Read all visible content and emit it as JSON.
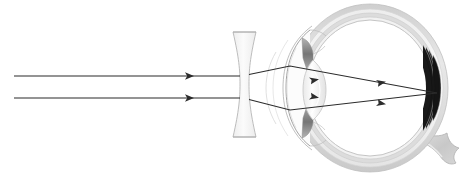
{
  "diagram": {
    "title": "Myopia correction with a diverging lens",
    "background_color": "#ffffff",
    "width": 470,
    "height": 177
  },
  "colors": {
    "ray_stroke": "#2b2b2b",
    "lens_fill": "#f2f2f2",
    "lens_stroke": "#b6b6b6",
    "sclera_outer": "#d2d2d2",
    "sclera_mid": "#e6e6e6",
    "sclera_inner": "#f4f4f4",
    "cornea_stroke": "#9a9a9a",
    "iris_fill": "#8e8e8e",
    "crystalline_fill": "#f6f6f6",
    "crystalline_stroke": "#c4c4c4",
    "retina_stroke": "#bdbdbd",
    "optic_nerve_fill": "#cfcfcf",
    "vitreous_fill": "#ffffff"
  },
  "rays": {
    "count": 2,
    "description": "Two parallel incoming light rays",
    "incoming": [
      {
        "name": "upper-ray",
        "x1": 14,
        "y1": 76,
        "x2": 233,
        "y2": 76,
        "arrow_x": 192,
        "arrow_y": 76
      },
      {
        "name": "lower-ray",
        "x1": 14,
        "y1": 98,
        "x2": 233,
        "y2": 98,
        "arrow_x": 192,
        "arrow_y": 98
      }
    ],
    "refracted": [
      {
        "name": "upper-refracted-ray",
        "points": "256,72 289,66 437,93",
        "arrow_x": 385,
        "arrow_y": 83
      },
      {
        "name": "lower-refracted-ray",
        "points": "256,101 289,110 437,93",
        "arrow_x": 385,
        "arrow_y": 104
      }
    ],
    "focus_point": {
      "x": 437,
      "y": 93,
      "label": "retina focal point"
    }
  },
  "corrective_lens": {
    "name": "biconcave-diverging-lens",
    "type": "concave",
    "x_left": 233,
    "x_right": 256,
    "y_top": 32,
    "y_bottom": 137,
    "waist_width": 7
  },
  "eye": {
    "name": "human-eye-cross-section",
    "center_x": 370,
    "center_y": 88,
    "radius_x": 78,
    "radius_y": 84,
    "parts": [
      {
        "name": "sclera",
        "label": "Sclera"
      },
      {
        "name": "cornea",
        "label": "Cornea"
      },
      {
        "name": "iris",
        "label": "Iris"
      },
      {
        "name": "crystalline-lens",
        "label": "Crystalline lens"
      },
      {
        "name": "vitreous-humor",
        "label": "Vitreous humor"
      },
      {
        "name": "retina",
        "label": "Retina"
      },
      {
        "name": "optic-nerve",
        "label": "Optic nerve"
      }
    ]
  }
}
